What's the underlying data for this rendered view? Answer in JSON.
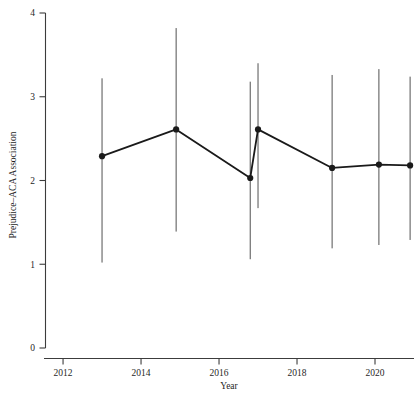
{
  "chart_data": {
    "type": "scatter",
    "title": "",
    "subtitle": "",
    "xlabel": "Year",
    "ylabel": "Prejudice–ACA Association",
    "xlim": [
      2011.55,
      2021.0
    ],
    "ylim": [
      0,
      4
    ],
    "grid": false,
    "legend": null,
    "xticks": [
      2012,
      2014,
      2016,
      2018,
      2020
    ],
    "xtick_labels": [
      "2012",
      "2014",
      "2016",
      "2018",
      "2020"
    ],
    "yticks": [
      0,
      1,
      2,
      3,
      4
    ],
    "ytick_labels": [
      "0",
      "1",
      "2",
      "3",
      "4"
    ],
    "marker": "filled-circle",
    "error_bars": "vertical",
    "connected": true,
    "series": [
      {
        "name": "Prejudice–ACA Association",
        "color": "#1a1a1a",
        "x": [
          2013.0,
          2014.9,
          2016.8,
          2017.0,
          2018.9,
          2020.1,
          2020.9
        ],
        "y": [
          2.29,
          2.61,
          2.03,
          2.61,
          2.15,
          2.19,
          2.18
        ],
        "y_lower": [
          1.02,
          1.39,
          1.06,
          1.67,
          1.19,
          1.23,
          1.29
        ],
        "y_upper": [
          3.22,
          3.82,
          3.18,
          3.4,
          3.26,
          3.33,
          3.24
        ]
      }
    ]
  },
  "axes": {
    "x_axis_name": "year-axis",
    "y_axis_name": "prejudice-aca-association-axis"
  }
}
